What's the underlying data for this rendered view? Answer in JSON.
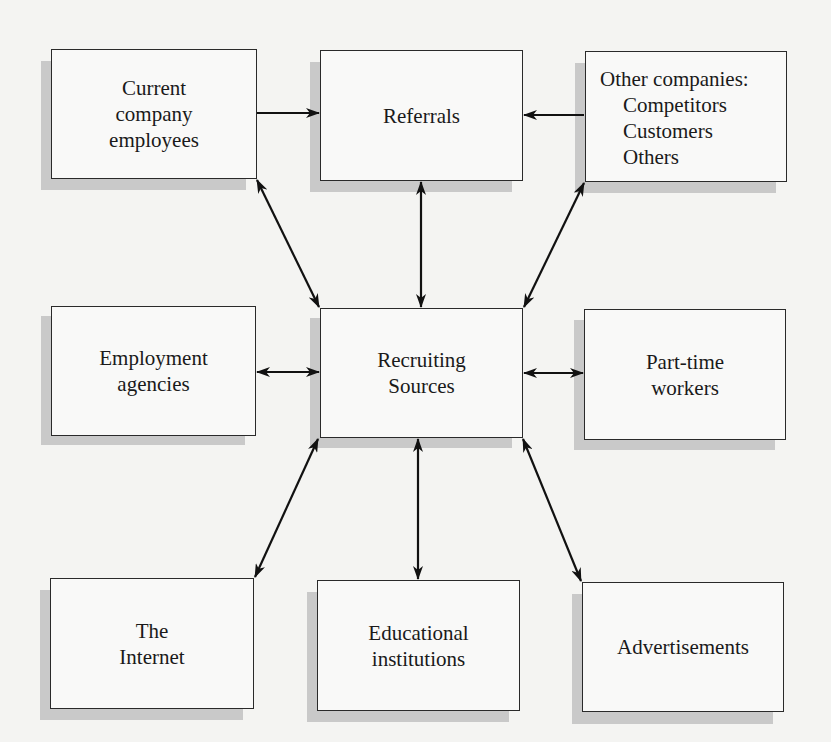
{
  "diagram": {
    "type": "flow",
    "title": "",
    "center_node": "recruiting_sources",
    "colors": {
      "background": "#f4f4f2",
      "box_fill": "#f9f9f8",
      "box_border": "#2a2a2a",
      "shadow": "#c9c9c9",
      "arrow": "#111111",
      "text": "#1a1a1a"
    },
    "nodes": {
      "current_employees": {
        "lines": [
          "Current",
          "company",
          "employees"
        ]
      },
      "referrals": {
        "lines": [
          "Referrals"
        ]
      },
      "other_companies": {
        "title": "Other companies:",
        "items": [
          "Competitors",
          "Customers",
          "Others"
        ]
      },
      "employment_agencies": {
        "lines": [
          "Employment",
          "agencies"
        ]
      },
      "recruiting_sources": {
        "lines": [
          "Recruiting",
          "Sources"
        ]
      },
      "part_time_workers": {
        "lines": [
          "Part-time",
          "workers"
        ]
      },
      "internet": {
        "lines": [
          "The",
          "Internet"
        ]
      },
      "educational_institutions": {
        "lines": [
          "Educational",
          "institutions"
        ]
      },
      "advertisements": {
        "lines": [
          "Advertisements"
        ]
      }
    },
    "edges": [
      {
        "from": "current_employees",
        "to": "referrals",
        "direction": "one-way"
      },
      {
        "from": "other_companies",
        "to": "referrals",
        "direction": "one-way"
      },
      {
        "from": "referrals",
        "to": "recruiting_sources",
        "direction": "both"
      },
      {
        "from": "current_employees",
        "to": "recruiting_sources",
        "direction": "both"
      },
      {
        "from": "other_companies",
        "to": "recruiting_sources",
        "direction": "both"
      },
      {
        "from": "employment_agencies",
        "to": "recruiting_sources",
        "direction": "both"
      },
      {
        "from": "part_time_workers",
        "to": "recruiting_sources",
        "direction": "both"
      },
      {
        "from": "internet",
        "to": "recruiting_sources",
        "direction": "both"
      },
      {
        "from": "educational_institutions",
        "to": "recruiting_sources",
        "direction": "both"
      },
      {
        "from": "advertisements",
        "to": "recruiting_sources",
        "direction": "both"
      }
    ]
  }
}
